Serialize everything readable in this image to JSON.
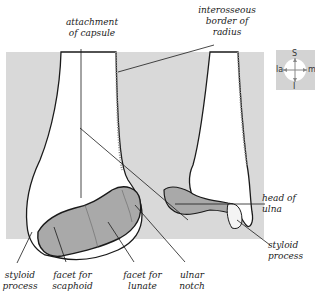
{
  "labels": {
    "attachment_of_capsule": "attachment\nof capsule",
    "interosseous_border": "interosseous\nborder of\nradius",
    "head_of_ulna": "head of\nulna",
    "styloid_process_ulna": "styloid\nprocess",
    "styloid_process_radius": "styloid\nprocess",
    "facet_for_scaphoid": "facet for\nscaphoid",
    "facet_for_lunate": "facet for\nlunate",
    "ulnar_notch": "ulnar\nnotch"
  },
  "orientation": {
    "superior": "S",
    "inferior": "I",
    "lateral": "la",
    "medial": "m"
  },
  "colors": {
    "background_panel": "#d9d9d9",
    "bone": "#ffffff",
    "articular_facet": "#a9a9a9",
    "outline": "#1a1a1a"
  }
}
